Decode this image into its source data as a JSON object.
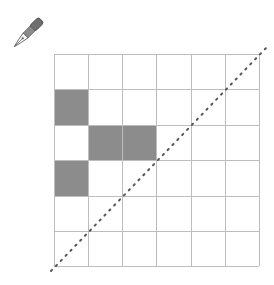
{
  "diagram": {
    "type": "grid",
    "rows": 6,
    "cols": 6,
    "x_lines": [
      54,
      88,
      122,
      156,
      191,
      225,
      259
    ],
    "y_lines": [
      54,
      89,
      125,
      160,
      196,
      231,
      266
    ],
    "grid_color": "#bdbdbd",
    "shade_color": "#8c8c8c",
    "shaded_cells": [
      {
        "row": 1,
        "col": 0
      },
      {
        "row": 2,
        "col": 1
      },
      {
        "row": 2,
        "col": 2
      },
      {
        "row": 3,
        "col": 0
      }
    ],
    "diagonal": {
      "style": "dotted",
      "color": "#555555",
      "from": [
        51,
        271
      ],
      "to": [
        267,
        47
      ]
    }
  },
  "icons": {
    "pen": {
      "name": "fountain-pen-icon",
      "x": 11,
      "y": 18
    }
  }
}
